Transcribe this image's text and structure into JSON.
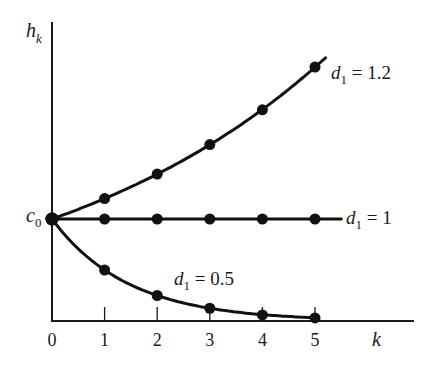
{
  "chart_data": {
    "type": "line",
    "title": "",
    "xlabel": "k",
    "ylabel": "h_k",
    "y_axis_label": {
      "main": "h",
      "sub": "k"
    },
    "y_reference_label": {
      "main": "c",
      "sub": "0"
    },
    "x": [
      0,
      1,
      2,
      3,
      4,
      5
    ],
    "x_tick_labels": [
      "0",
      "1",
      "2",
      "3",
      "4",
      "5"
    ],
    "xlim": [
      0,
      6.2
    ],
    "ylim": [
      0,
      2.8
    ],
    "grid": false,
    "legend_position": "inline-right",
    "series": [
      {
        "name": "d1 = 1.2",
        "label_main": "d",
        "label_sub": "1",
        "label_rest": " = 1.2",
        "d1": 1.2,
        "values": [
          1.0,
          1.2,
          1.44,
          1.73,
          2.07,
          2.49
        ]
      },
      {
        "name": "d1 = 1",
        "label_main": "d",
        "label_sub": "1",
        "label_rest": " = 1",
        "d1": 1,
        "values": [
          1.0,
          1.0,
          1.0,
          1.0,
          1.0,
          1.0
        ]
      },
      {
        "name": "d1 = 0.5",
        "label_main": "d",
        "label_sub": "1",
        "label_rest": " = 0.5",
        "d1": 0.5,
        "values": [
          1.0,
          0.5,
          0.25,
          0.125,
          0.06,
          0.03
        ]
      }
    ],
    "annotations": [
      "c0 marks h_0 on the vertical axis"
    ]
  }
}
